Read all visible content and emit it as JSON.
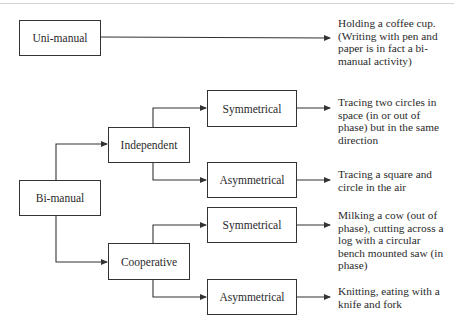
{
  "diagram": {
    "nodes": {
      "uni_manual": "Uni-manual",
      "bi_manual": "Bi-manual",
      "independent": "Independent",
      "cooperative": "Cooperative",
      "independent_symmetrical": "Symmetrical",
      "independent_asymmetrical": "Asymmetrical",
      "cooperative_symmetrical": "Symmetrical",
      "cooperative_asymmetrical": "Asymmetrical"
    },
    "examples": {
      "uni_manual": "Holding a coffee cup. (Writing with pen and paper is in fact a bi-manual activity)",
      "independent_symmetrical": "Tracing two circles in space (in or out of phase) but in the same direction",
      "independent_asymmetrical": "Tracing a square and circle in the air",
      "cooperative_symmetrical": "Milking a cow (out of phase), cutting across a log with a circular bench mounted saw (in phase)",
      "cooperative_asymmetrical": "Knitting, eating with a knife and fork"
    },
    "edges": [
      [
        "Uni-manual",
        "example"
      ],
      [
        "Bi-manual",
        "Independent"
      ],
      [
        "Bi-manual",
        "Cooperative"
      ],
      [
        "Independent",
        "Symmetrical"
      ],
      [
        "Independent",
        "Asymmetrical"
      ],
      [
        "Cooperative",
        "Symmetrical"
      ],
      [
        "Cooperative",
        "Asymmetrical"
      ]
    ],
    "colors": {
      "line": "#333333",
      "text": "#2a2a2a",
      "background": "#ffffff"
    }
  }
}
